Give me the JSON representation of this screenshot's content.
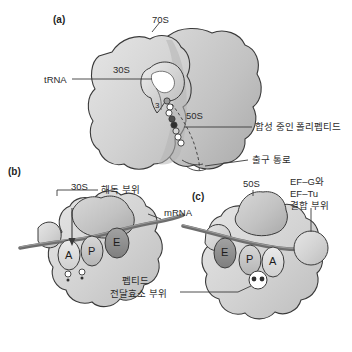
{
  "figure": {
    "background_color": "#ffffff",
    "ink_color": "#2b2b2b"
  },
  "panels": [
    {
      "id": "a",
      "label": "(a)",
      "caption_labels": {
        "whole": "70S",
        "small_subunit": "30S",
        "large_subunit": "50S",
        "trna": "tRNA",
        "nascent_chain": "합성 중인 폴리펩티드",
        "exit_tunnel": "출구 통로",
        "trna_end": "3"
      }
    },
    {
      "id": "b",
      "label": "(b)",
      "caption_labels": {
        "subunit": "30S",
        "decoding_site": "해독 부위",
        "mrna": "mRNA"
      },
      "sites": [
        "A",
        "P",
        "E"
      ]
    },
    {
      "id": "c",
      "label": "(c)",
      "caption_labels": {
        "subunit": "50S",
        "factor_binding_site": "EF–G와\nEF–Tu\n결합 부위",
        "factor_binding_line1": "EF–G와",
        "factor_binding_line2": "EF–Tu",
        "factor_binding_line3": "결합 부위",
        "peptidyl_transferase_line1": "펩티드",
        "peptidyl_transferase_line2": "전달효소 부위"
      },
      "sites": [
        "E",
        "P",
        "A"
      ]
    }
  ],
  "colors": {
    "subunit_light": "#d9d9d9",
    "subunit_mid": "#c4c4c4",
    "subunit_dark": "#ababab",
    "site_a": "#dcdcdc",
    "site_p": "#c6c6c6",
    "site_e": "#8f8f8f",
    "mrna": "#6e6e6e",
    "outline": "#3a3a3a",
    "bead_fill": "#ffffff",
    "bead_dark": "#4a4a4a"
  }
}
